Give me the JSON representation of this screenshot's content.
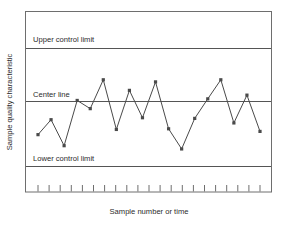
{
  "chart_data": {
    "type": "line",
    "title": "",
    "xlabel": "Sample number or time",
    "ylabel": "Sample quality characteristic",
    "grid": false,
    "legend": "none",
    "xlim": [
      0,
      22
    ],
    "ylim": [
      -1.6,
      1.75
    ],
    "x": [
      1,
      2,
      3,
      4,
      5,
      6,
      7,
      8,
      9,
      10,
      11,
      12,
      13,
      14,
      15,
      16,
      17,
      18
    ],
    "values": [
      -0.51,
      -0.28,
      -0.68,
      0.02,
      -0.11,
      0.41,
      -0.43,
      0.21,
      -0.25,
      0.37,
      -0.42,
      -0.73,
      -0.26,
      0.05,
      0.41,
      -0.33,
      0.12,
      -0.46
    ],
    "series": [
      {
        "name": "Sample quality characteristic",
        "values": [
          -0.51,
          -0.28,
          -0.68,
          0.02,
          -0.11,
          0.41,
          -0.43,
          0.21,
          -0.25,
          0.37,
          -0.42,
          -0.73,
          -0.26,
          0.05,
          0.41,
          -0.33,
          0.12,
          -0.46
        ],
        "color": "#4a4a4a",
        "marker": "square"
      }
    ],
    "reference_lines": [
      {
        "name": "upper-control-limit",
        "label": "Upper control limit",
        "value": 1.0,
        "color": "#555555"
      },
      {
        "name": "center-line",
        "label": "Center line",
        "value": 0.0,
        "color": "#555555"
      },
      {
        "name": "lower-control-limit",
        "label": "Lower control limit",
        "value": -1.0,
        "color": "#555555"
      }
    ],
    "tick_count": 21,
    "tick_labels": []
  },
  "labels": {
    "y_axis": "Sample quality characteristic",
    "x_axis": "Sample number or time",
    "upper_control_limit": "Upper control limit",
    "center_line": "Center line",
    "lower_control_limit": "Lower control limit"
  },
  "colors": {
    "plot_border": "#6e6e6e",
    "reference_line": "#555555",
    "series_line": "#4a4a4a",
    "marker": "#3c3c3c",
    "text": "#2b2b2b",
    "background": "#ffffff"
  }
}
